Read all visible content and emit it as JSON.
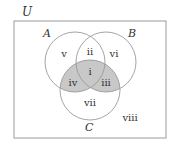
{
  "diagram": {
    "type": "venn-3-set",
    "universe_label": "U",
    "sets": [
      {
        "label": "A",
        "cx": 75,
        "cy": 62,
        "r": 30
      },
      {
        "label": "B",
        "cx": 106,
        "cy": 62,
        "r": 30
      },
      {
        "label": "C",
        "cx": 90,
        "cy": 90,
        "r": 30
      }
    ],
    "regions": {
      "i": "i",
      "ii": "ii",
      "iii": "iii",
      "iv": "iv",
      "v": "v",
      "vi": "vi",
      "vii": "vii",
      "viii": "viii"
    },
    "shaded_regions": [
      "i",
      "iii",
      "iv"
    ],
    "colors": {
      "stroke": "#9a9a9a",
      "shade": "#c8c8c8",
      "text": "#333333"
    }
  }
}
